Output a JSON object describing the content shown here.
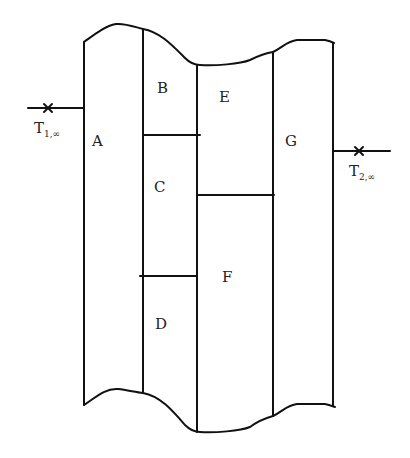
{
  "diagram": {
    "type": "composite-wall-cross-section",
    "regions": [
      {
        "id": "A",
        "label": "A"
      },
      {
        "id": "B",
        "label": "B"
      },
      {
        "id": "C",
        "label": "C"
      },
      {
        "id": "D",
        "label": "D"
      },
      {
        "id": "E",
        "label": "E"
      },
      {
        "id": "F",
        "label": "F"
      },
      {
        "id": "G",
        "label": "G"
      }
    ],
    "left_ambient": {
      "symbol": "T",
      "subscript": "1,∞"
    },
    "right_ambient": {
      "symbol": "T",
      "subscript": "2,∞"
    },
    "colors": {
      "line": "#111111",
      "text": "#222222",
      "background": "#ffffff"
    }
  }
}
